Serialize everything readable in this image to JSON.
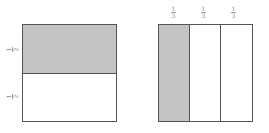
{
  "figures": [
    {
      "name": "halves-square",
      "orientation": "horizontal-split",
      "parts": 2,
      "shaded_parts": [
        0
      ],
      "labels": [
        {
          "numerator": "1",
          "denominator": "2"
        },
        {
          "numerator": "1",
          "denominator": "2"
        }
      ]
    },
    {
      "name": "thirds-square",
      "orientation": "vertical-split",
      "parts": 3,
      "shaded_parts": [
        0
      ],
      "labels": [
        {
          "numerator": "1",
          "denominator": "3"
        },
        {
          "numerator": "1",
          "denominator": "3"
        },
        {
          "numerator": "1",
          "denominator": "3"
        }
      ]
    }
  ],
  "colors": {
    "shade": "#c4c4c4",
    "border": "#555555",
    "label": "#888888"
  }
}
